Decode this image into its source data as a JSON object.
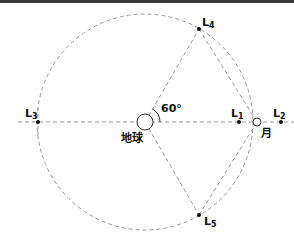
{
  "diagram": {
    "center_label": "地球",
    "moon_label": "月",
    "angle_label": "60°",
    "points": [
      {
        "id": "L1",
        "main": "L",
        "sub": "1"
      },
      {
        "id": "L2",
        "main": "L",
        "sub": "2"
      },
      {
        "id": "L3",
        "main": "L",
        "sub": "3"
      },
      {
        "id": "L4",
        "main": "L",
        "sub": "4"
      },
      {
        "id": "L5",
        "main": "L",
        "sub": "5"
      }
    ],
    "colors": {
      "line": "#9a9a9a",
      "text": "#111111",
      "point": "#111111",
      "topbar": "#3a3a3a"
    }
  }
}
